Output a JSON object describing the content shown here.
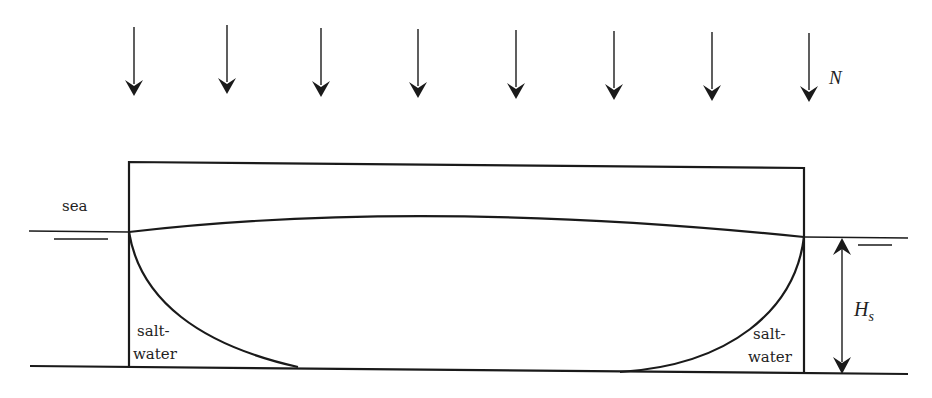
{
  "diagram": {
    "type": "cross-section",
    "labels": {
      "sea": "sea",
      "left_region_line1": "salt-",
      "left_region_line2": "water",
      "right_region_line1": "salt-",
      "right_region_line2": "water",
      "load": "N",
      "height_main": "H",
      "height_sub": "s"
    },
    "load_arrows_x": [
      134,
      227,
      321,
      418,
      516,
      614,
      712,
      809
    ],
    "colors": {
      "stroke": "#1a1a1a",
      "text": "#222222",
      "background": "#ffffff"
    }
  }
}
